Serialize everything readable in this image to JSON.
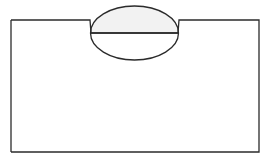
{
  "figure": {
    "name": "notched-block-with-lens-diagram",
    "canvas": {
      "width": 270,
      "height": 162,
      "background_color": "#ffffff"
    },
    "style": {
      "stroke_color": "#2b2b2b",
      "stroke_width": 1.3,
      "shade_fill_color": "#f2f2f2",
      "body_fill_color": "#ffffff"
    },
    "shapes": {
      "block": {
        "name": "notched-rectangle-block",
        "left": 11,
        "right": 259,
        "top": 20,
        "bottom": 152,
        "fill": "#ffffff",
        "outline_points": "11,20 90,20 91,33 178,33 179,20 259,20 259,152 11,152"
      },
      "notch": {
        "name": "top-edge-notch",
        "left_top_x": 90,
        "left_bottom_x": 91,
        "right_bottom_x": 178,
        "right_top_x": 179,
        "top_y": 20,
        "bottom_y": 33,
        "depth": 13,
        "mouth_width": 89
      },
      "lens": {
        "name": "ellipse-lens",
        "center_x": 134.5,
        "center_y": 33,
        "radius_x": 44,
        "radius_y": 27,
        "top_y": 6,
        "bottom_y": 60,
        "left_x": 90.5,
        "right_x": 178.5
      },
      "chord": {
        "name": "horizontal-chord-line",
        "y": 33,
        "x_start": 90.5,
        "x_end": 178.5
      },
      "upper_lens_region": {
        "name": "shaded-upper-lens",
        "fill": "#f2f2f2",
        "path": "M 90.5 33 A 44 27 0 0 1 178.5 33 Z"
      },
      "lower_lens_region": {
        "name": "unshaded-lower-lens",
        "fill": "#ffffff",
        "path": "M 90.5 33 A 44 27 0 0 0 178.5 33 Z"
      }
    },
    "labels": []
  }
}
